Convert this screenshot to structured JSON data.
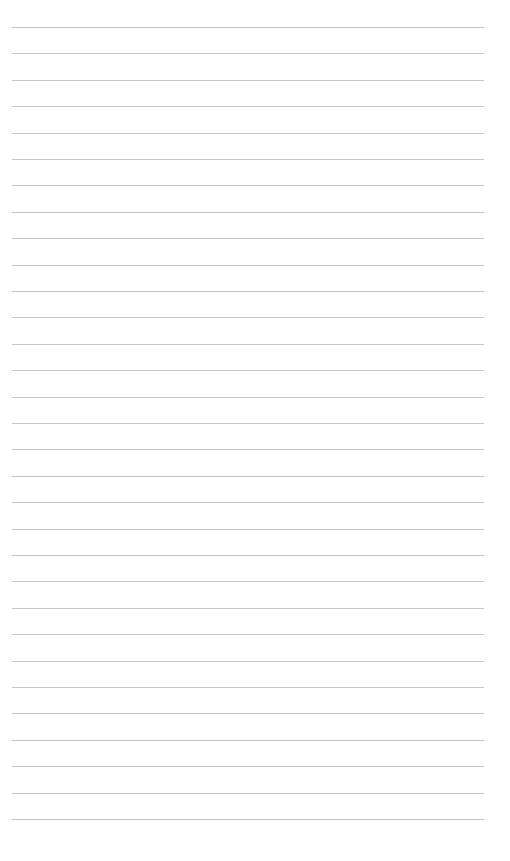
{
  "page": {
    "type": "lined-paper",
    "background": "#ffffff",
    "line_color": "#c4c4c4",
    "line_count": 31,
    "first_line_y": 27,
    "line_spacing": 26.4,
    "line_left": 12,
    "line_width": 472
  }
}
